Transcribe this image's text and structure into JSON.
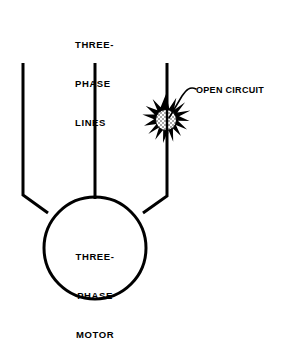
{
  "diagram": {
    "background_color": "#ffffff",
    "stroke_color": "#000000",
    "fault_fill_color": "#d0d0d0",
    "labels": {
      "supply_lines": {
        "line1": "THREE-",
        "line2": "PHASE",
        "line3": "LINES"
      },
      "motor": {
        "line1": "THREE-",
        "line2": "PHASE",
        "line3": "MOTOR"
      },
      "fault": {
        "text": "OPEN CIRCUIT"
      }
    },
    "elements": {
      "motor_circle": {
        "name": "three-phase motor",
        "center_x": 95,
        "center_y": 248,
        "radius": 51
      },
      "phase_line_left": {
        "name": "left phase conductor",
        "top_x": 23,
        "top_y": 63,
        "bend_x": 23,
        "bend_y": 195,
        "end_x": 48,
        "end_y": 213
      },
      "phase_line_center": {
        "name": "center phase conductor",
        "top_x": 95,
        "top_y": 63,
        "end_x": 95,
        "end_y": 198
      },
      "phase_line_right": {
        "name": "right phase conductor",
        "top_x": 167,
        "top_y": 63,
        "bend_x": 167,
        "bend_y": 196,
        "end_x": 143,
        "end_y": 213
      },
      "fault_starburst": {
        "name": "open circuit fault burst",
        "center_x": 166,
        "center_y": 120,
        "outer_radius": 23,
        "core_radius": 11,
        "spike_count": 14
      },
      "leader_line": {
        "name": "callout leader to fault",
        "from_x": 196,
        "from_y": 89,
        "to_x": 169,
        "to_y": 119
      }
    }
  }
}
